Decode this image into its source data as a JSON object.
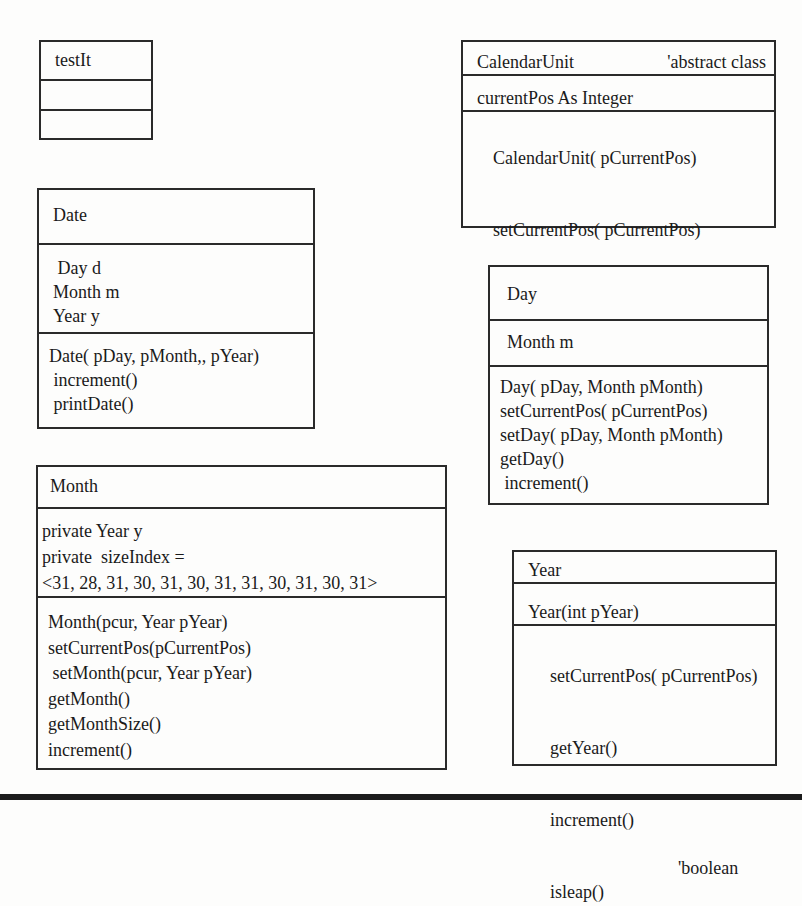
{
  "diagram": {
    "type": "uml-class-diagram",
    "classes": {
      "testIt": {
        "name": "testIt",
        "attributes": [],
        "methods": []
      },
      "calendarUnit": {
        "name": "CalendarUnit",
        "stereotype": "'abstract class",
        "attributes": [
          "currentPos As Integer"
        ],
        "methods": [
          {
            "signature": "CalendarUnit( pCurrentPos)",
            "note": ""
          },
          {
            "signature": "setCurrentPos( pCurrentPos)",
            "note": ""
          },
          {
            "signature": "increment()",
            "note": "'boolean"
          }
        ]
      },
      "date": {
        "name": "Date",
        "attributes": [
          " Day d",
          "Month m",
          "Year y"
        ],
        "methods": [
          {
            "signature": "Date( pDay, pMonth,, pYear)"
          },
          {
            "signature": " increment()"
          },
          {
            "signature": " printDate()"
          }
        ]
      },
      "day": {
        "name": "Day",
        "attributes": [
          "Month m"
        ],
        "methods": [
          {
            "signature": "Day( pDay, Month pMonth)"
          },
          {
            "signature": "setCurrentPos( pCurrentPos)"
          },
          {
            "signature": "setDay( pDay, Month pMonth)"
          },
          {
            "signature": "getDay()"
          },
          {
            "signature": " increment()"
          }
        ]
      },
      "month": {
        "name": "Month",
        "attributes": [
          "private Year y",
          "private  sizeIndex =",
          "<31, 28, 31, 30, 31, 30, 31, 31, 30, 31, 30, 31>"
        ],
        "methods": [
          {
            "signature": "Month(pcur, Year pYear)"
          },
          {
            "signature": "setCurrentPos(pCurrentPos)"
          },
          {
            "signature": " setMonth(pcur, Year pYear)"
          },
          {
            "signature": "getMonth()"
          },
          {
            "signature": "getMonthSize()"
          },
          {
            "signature": "increment()"
          }
        ]
      },
      "year": {
        "name": "Year",
        "attributes": [
          "Year(int pYear)"
        ],
        "methods": [
          {
            "signature": "setCurrentPos( pCurrentPos)",
            "note": ""
          },
          {
            "signature": "getYear()",
            "note": ""
          },
          {
            "signature": "increment()",
            "note": ""
          },
          {
            "signature": "isleap()",
            "note": "'boolean"
          }
        ]
      }
    }
  },
  "colors": {
    "background": "#fdfdfc",
    "stroke": "#2a2a2a",
    "text": "#1a1a1a",
    "bottom_bar": "#1c1c1c"
  }
}
